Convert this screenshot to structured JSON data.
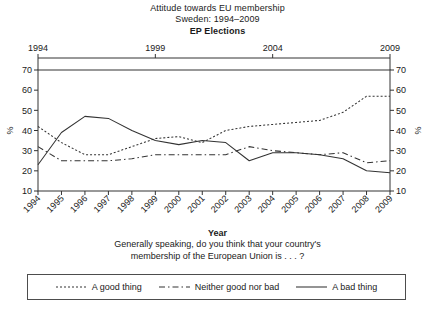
{
  "title": {
    "line1": "Attitude towards EU membership",
    "line2": "Sweden: 1994–2009",
    "line3": "EP Elections"
  },
  "caption": {
    "axis_title": "Year",
    "question_line1": "Generally speaking, do you think that your country's",
    "question_line2": "membership of the European Union is . . . ?"
  },
  "axes": {
    "y_label_left": "%",
    "y_label_right": "%",
    "y_ticks": [
      "10",
      "20",
      "30",
      "40",
      "50",
      "60",
      "70"
    ],
    "x_ticks": [
      "1994",
      "1995",
      "1996",
      "1997",
      "1998",
      "1999",
      "2000",
      "2001",
      "2002",
      "2003",
      "2004",
      "2005",
      "2006",
      "2007",
      "2008",
      "2009"
    ],
    "top_axis_ticks": [
      "1994",
      "1999",
      "2004",
      "2009"
    ]
  },
  "legend": {
    "entries": [
      {
        "label": "A good thing",
        "style": "dotted",
        "dash": "2,2",
        "swatch_icon": "dotted-line-icon"
      },
      {
        "label": "Neither good nor bad",
        "style": "dash-dot",
        "dash": "6,3,1.5,3",
        "swatch_icon": "dashed-line-icon"
      },
      {
        "label": "A bad thing",
        "style": "solid",
        "dash": "",
        "swatch_icon": "solid-line-icon"
      }
    ]
  },
  "chart_data": {
    "type": "line",
    "subtitle": "Generally speaking, do you think that your country's membership of the European Union is . . . ?",
    "xlabel": "Year",
    "ylabel": "%",
    "xlim": [
      1994,
      2009
    ],
    "ylim": [
      10,
      70
    ],
    "grid": false,
    "legend_position": "bottom",
    "x": [
      1994,
      1995,
      1996,
      1997,
      1998,
      1999,
      2000,
      2001,
      2002,
      2003,
      2004,
      2005,
      2006,
      2007,
      2008,
      2009
    ],
    "series": [
      {
        "name": "A good thing",
        "linestyle": "dotted",
        "values": [
          42,
          34,
          28,
          28,
          32,
          36,
          37,
          34,
          40,
          42,
          43,
          44,
          45,
          49,
          57,
          57
        ]
      },
      {
        "name": "Neither good nor bad",
        "linestyle": "dash-dot",
        "values": [
          32,
          25,
          25,
          25,
          26,
          28,
          28,
          28,
          28,
          32,
          30,
          29,
          28,
          29,
          24,
          25
        ]
      },
      {
        "name": "A bad thing",
        "linestyle": "solid",
        "values": [
          23,
          39,
          47,
          46,
          40,
          35,
          33,
          35,
          34,
          25,
          29,
          29,
          28,
          26,
          20,
          19
        ]
      }
    ],
    "election_years": [
      1994,
      1999,
      2004,
      2009
    ]
  }
}
